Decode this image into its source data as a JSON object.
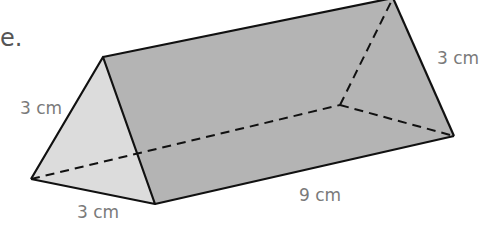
{
  "figure": {
    "type": "triangular-prism",
    "text_fragment": "e.",
    "labels": {
      "front_left_edge": "3 cm",
      "front_bottom_edge": "3 cm",
      "length_edge": "9 cm",
      "back_right_edge": "3 cm"
    },
    "colors": {
      "front_face": "#dcdcdc",
      "side_face": "#b4b4b4",
      "edge": "#111111",
      "label": "#7a7a7a"
    }
  }
}
